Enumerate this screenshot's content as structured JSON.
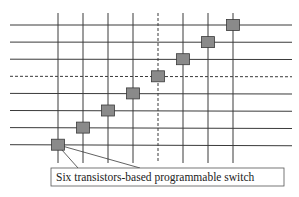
{
  "diagram": {
    "type": "switch-matrix",
    "horizontal_wires": [
      {
        "id": "h1",
        "style": "solid"
      },
      {
        "id": "h2",
        "style": "solid"
      },
      {
        "id": "h3",
        "style": "solid"
      },
      {
        "id": "h4",
        "style": "dashed"
      },
      {
        "id": "h5",
        "style": "solid"
      },
      {
        "id": "h6",
        "style": "solid"
      },
      {
        "id": "h7",
        "style": "solid"
      },
      {
        "id": "h8",
        "style": "solid"
      }
    ],
    "vertical_wires": [
      {
        "id": "v1",
        "style": "solid"
      },
      {
        "id": "v2",
        "style": "solid"
      },
      {
        "id": "v3",
        "style": "solid"
      },
      {
        "id": "v4",
        "style": "solid"
      },
      {
        "id": "v5",
        "style": "dashed"
      },
      {
        "id": "v6",
        "style": "solid"
      },
      {
        "id": "v7",
        "style": "solid"
      },
      {
        "id": "v8",
        "style": "solid"
      }
    ],
    "switches": [
      {
        "col": 1,
        "row": 8
      },
      {
        "col": 2,
        "row": 7
      },
      {
        "col": 3,
        "row": 6
      },
      {
        "col": 4,
        "row": 5
      },
      {
        "col": 5,
        "row": 4
      },
      {
        "col": 6,
        "row": 3
      },
      {
        "col": 7,
        "row": 2
      },
      {
        "col": 8,
        "row": 1
      }
    ],
    "switch_color": "#8a8a8a",
    "callout": {
      "label": "Six transistors-based programmable switch",
      "target_switch": 0
    }
  }
}
